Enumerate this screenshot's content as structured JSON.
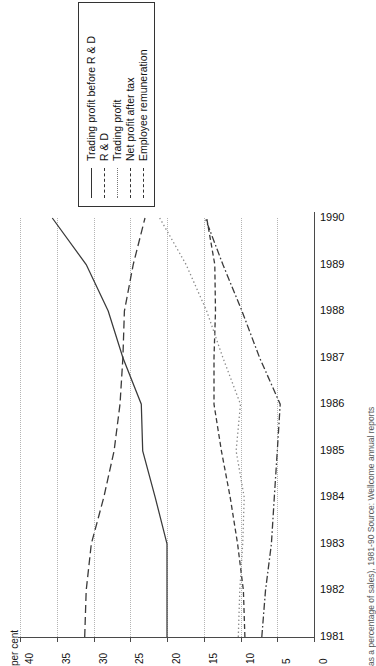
{
  "figure": {
    "orientation": "rotated-90",
    "caption": "Figure 9  Wellcome plc: key financial ratios (as a percentage of sales), 1981-90 Source: Wellcome annual reports",
    "caption_short": "as a percentage of sales), 1981-90 Source: Wellcome annual reports"
  },
  "axis": {
    "value_axis_title": "per cent",
    "value_ticks": [
      "40",
      "35",
      "30",
      "25",
      "20",
      "15",
      "10",
      "5",
      "0"
    ],
    "value_tick_numbers": [
      40,
      35,
      30,
      25,
      20,
      15,
      10,
      5,
      0
    ],
    "category_ticks": [
      "1990",
      "1989",
      "1988",
      "1987",
      "1986",
      "1985",
      "1984",
      "1983",
      "1982",
      "1981"
    ]
  },
  "legend": {
    "items": [
      {
        "label": "Trading profit before R & D",
        "style": "solid"
      },
      {
        "label": "R & D",
        "style": "dashed"
      },
      {
        "label": "Trading profit",
        "style": "dotted"
      },
      {
        "label": "Net profit after tax",
        "style": "dash-dot"
      },
      {
        "label": "Employee remuneration",
        "style": "long-dash"
      }
    ]
  },
  "chart_data": {
    "type": "line",
    "xlabel": "",
    "ylabel": "per cent",
    "x": [
      1981,
      1982,
      1983,
      1984,
      1985,
      1986,
      1987,
      1988,
      1989,
      1990
    ],
    "ylim": [
      0,
      40
    ],
    "grid": true,
    "legend_position": "top-left",
    "orientation": "horizontal-years-vertical-axis",
    "series": [
      {
        "name": "Trading profit before R & D",
        "style": "solid",
        "values": [
          20.0,
          20.0,
          20.0,
          21.6,
          23.3,
          23.5,
          26.0,
          28.0,
          31.0,
          35.6
        ]
      },
      {
        "name": "R & D",
        "style": "dashed",
        "values": [
          9.4,
          9.6,
          10.4,
          11.4,
          12.6,
          13.6,
          13.6,
          13.4,
          13.5,
          14.6
        ]
      },
      {
        "name": "Trading profit",
        "style": "dotted",
        "values": [
          10.3,
          10.1,
          9.7,
          9.5,
          10.6,
          10.0,
          12.4,
          14.6,
          17.4,
          21.0
        ]
      },
      {
        "name": "Net profit after tax",
        "style": "dash-dot",
        "values": [
          7.1,
          6.6,
          5.8,
          5.4,
          5.0,
          4.6,
          7.4,
          9.8,
          12.4,
          14.8
        ]
      },
      {
        "name": "Employee remuneration",
        "style": "long-dash",
        "values": [
          31.2,
          31.0,
          30.3,
          28.6,
          27.2,
          26.4,
          26.0,
          25.8,
          24.6,
          23.0
        ]
      }
    ]
  }
}
